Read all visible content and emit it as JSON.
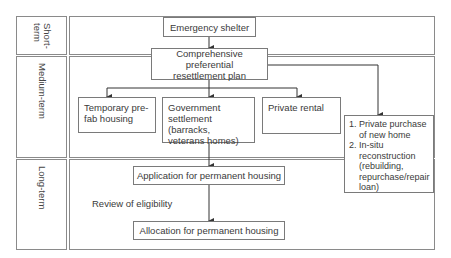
{
  "lanes": {
    "short": "Short-\nterm",
    "medium": "Medium-term",
    "long": "Long-term"
  },
  "boxes": {
    "emergency_shelter": "Emergency shelter",
    "comprehensive_plan_line1": "Comprehensive preferential",
    "comprehensive_plan_line2": "resettlement plan",
    "temporary_prefab_line1": "Temporary pre-",
    "temporary_prefab_line2": "fab housing",
    "government_settlement_line1": "Government",
    "government_settlement_line2": "settlement (barracks,",
    "government_settlement_line3": "veterans homes)",
    "private_rental": "Private rental",
    "private_options": {
      "item1_line1": "Private purchase",
      "item1_line2": "of new home",
      "item2_line1": "In-situ",
      "item2_line2": "reconstruction",
      "item2_line3": "(rebuilding,",
      "item2_line4": "repurchase/repair",
      "item2_line5": "loan)"
    },
    "application": "Application for permanent housing",
    "allocation": "Allocation for permanent housing"
  },
  "annotations": {
    "review": "Review of eligibility"
  },
  "colors": {
    "border": "#8a8a8a",
    "text": "#3a3a3a",
    "arrow": "#333333"
  }
}
